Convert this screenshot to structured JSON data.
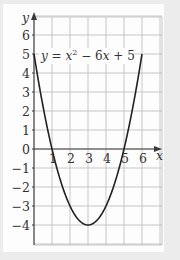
{
  "chart_data": {
    "type": "line",
    "title": "",
    "equation": "y = x² − 6x + 5",
    "xlabel": "x",
    "ylabel": "y",
    "xlim": [
      0,
      6.5
    ],
    "ylim": [
      -5.2,
      6.8
    ],
    "grid": true,
    "x_ticks": [
      1,
      2,
      3,
      4,
      5,
      6
    ],
    "y_ticks": [
      6,
      5,
      4,
      3,
      2,
      1,
      0,
      -1,
      -2,
      -3,
      -4
    ],
    "series": [
      {
        "name": "y = x^2 - 6x + 5",
        "x": [
          0,
          0.5,
          1,
          1.5,
          2,
          2.5,
          3,
          3.5,
          4,
          4.5,
          5,
          5.5,
          6
        ],
        "y": [
          5,
          2.25,
          0,
          -1.75,
          -3,
          -3.75,
          -4,
          -3.75,
          -3,
          -1.75,
          0,
          2.25,
          5
        ]
      }
    ],
    "key_points": {
      "roots": [
        1,
        5
      ],
      "vertex": [
        3,
        -4
      ],
      "y_intercept": 5
    }
  },
  "labels": {
    "x_axis": "x",
    "y_axis": "y",
    "equation_parts": {
      "y": "y",
      "eq": " = ",
      "x": "x",
      "exp": "2",
      "rest": " − 6",
      "x2": "x",
      "tail": " + 5"
    },
    "x_tick_labels": [
      "1",
      "2",
      "3",
      "4",
      "5",
      "6"
    ],
    "y_tick_labels": [
      "6",
      "5",
      "4",
      "3",
      "2",
      "1",
      "0",
      "−1",
      "−2",
      "−3",
      "−4"
    ]
  },
  "colors": {
    "grid": "#b9b9b9",
    "axis": "#3a3a3a",
    "curve": "#222222",
    "card": "#fdfdfd",
    "background": "#ececec"
  }
}
